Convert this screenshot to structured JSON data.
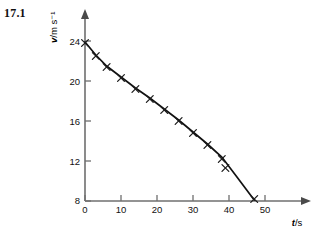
{
  "figure": {
    "label": "17.1"
  },
  "chart_data": {
    "type": "scatter",
    "title": "",
    "subtitle": "",
    "xlabel": "t/s",
    "xlabel_symbol": "t",
    "xlabel_unit": "/s",
    "ylabel": "v/m s⁻¹",
    "ylabel_symbol": "v",
    "ylabel_unit": "/m s⁻¹",
    "xlim": [
      0,
      55
    ],
    "ylim": [
      8,
      25
    ],
    "xticks": [
      0,
      10,
      20,
      30,
      40,
      50
    ],
    "xtick_labels": [
      "0",
      "10",
      "20",
      "30",
      "40",
      "50"
    ],
    "yticks": [
      8,
      12,
      16,
      20,
      24
    ],
    "ytick_labels": [
      "8",
      "12",
      "16",
      "20",
      "24"
    ],
    "grid": false,
    "legend": false,
    "legend_position": "none",
    "marker": "x",
    "marker_color": "#1b1b1b",
    "line_color": "#111111",
    "axis_color": "#6f6f6f",
    "x": [
      0,
      3,
      6,
      10,
      14,
      18,
      22,
      26,
      30,
      34,
      38,
      39,
      47
    ],
    "y": [
      23.8,
      22.5,
      21.4,
      20.3,
      19.2,
      18.2,
      17.1,
      16.0,
      14.8,
      13.6,
      12.2,
      11.3,
      8.2
    ],
    "series": [
      {
        "name": "velocity",
        "values": [
          23.8,
          22.5,
          21.4,
          20.3,
          19.2,
          18.2,
          17.1,
          16.0,
          14.8,
          13.6,
          12.2,
          11.3,
          8.2
        ]
      }
    ],
    "fit_line": {
      "x": [
        0,
        3,
        6,
        10,
        14,
        18,
        22,
        26,
        30,
        34,
        38,
        42,
        47
      ],
      "y": [
        23.9,
        22.6,
        21.5,
        20.4,
        19.3,
        18.3,
        17.2,
        16.1,
        14.9,
        13.7,
        12.4,
        10.5,
        8.1
      ]
    }
  }
}
